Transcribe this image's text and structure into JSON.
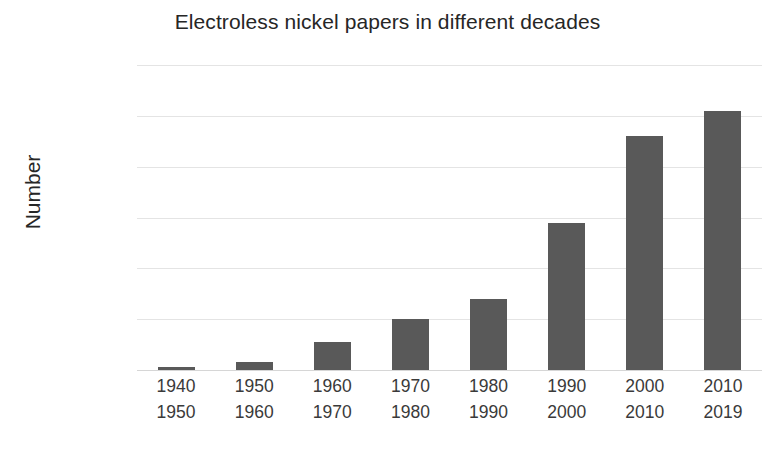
{
  "chart_data": {
    "type": "bar",
    "title": "Electroless nickel papers in different decades",
    "xlabel": "",
    "ylabel": "Number",
    "categories": [
      "1940\n1950",
      "1950\n1960",
      "1960\n1970",
      "1970\n1980",
      "1980\n1990",
      "1990\n2000",
      "2000\n2010",
      "2010\n2019"
    ],
    "category_lines": [
      [
        "1940",
        "1950"
      ],
      [
        "1950",
        "1960"
      ],
      [
        "1960",
        "1970"
      ],
      [
        "1970",
        "1980"
      ],
      [
        "1980",
        "1990"
      ],
      [
        "1990",
        "2000"
      ],
      [
        "2000",
        "2010"
      ],
      [
        "2010",
        "2019"
      ]
    ],
    "values": [
      300,
      800,
      2800,
      5000,
      7000,
      14500,
      23000,
      25500
    ],
    "ylim": [
      0,
      30000
    ],
    "yticks": [
      0,
      5000,
      10000,
      15000,
      20000,
      25000,
      30000
    ],
    "ytick_labels": [
      "0",
      "5000",
      "10000",
      "15000",
      "20000",
      "25000",
      "30000"
    ],
    "grid": true,
    "legend": false,
    "bar_color": "#595959",
    "grid_color": "#e4e4e4",
    "text_color": "#3a3a3a"
  }
}
